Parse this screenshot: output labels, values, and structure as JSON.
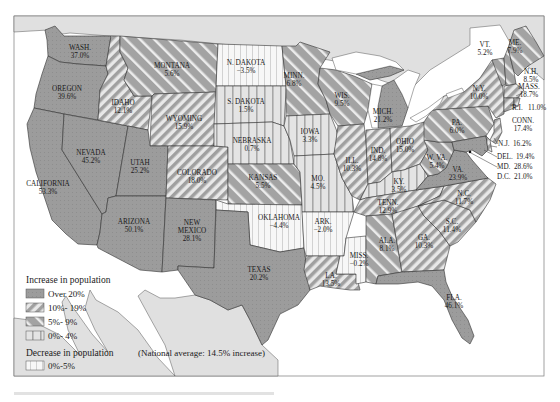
{
  "map": {
    "title": "Population change by state",
    "national_average": "(National average: 14.5% increase)",
    "colors": {
      "background_sea": "#ffffff",
      "neighbor_land": "#dedede",
      "over20": "#9a9a9a",
      "hatch_dark": "#9a9a9a",
      "hatch_light": "#e6e6e6",
      "vertical_dark": "#bdbdbd",
      "vertical_light": "#ececec",
      "border": "#333333",
      "lakes": "#ffffff"
    }
  },
  "legend": {
    "increase_title": "Increase in population",
    "decrease_title": "Decrease in population",
    "items": [
      {
        "key": "over20",
        "label": "Over 20%"
      },
      {
        "key": "p10_19",
        "label": "10%- 19%"
      },
      {
        "key": "p5_9",
        "label": "5%- 9%"
      },
      {
        "key": "p0_4",
        "label": "0%- 4%"
      },
      {
        "key": "dec0_5",
        "label": "0%-5%"
      }
    ]
  },
  "states": [
    {
      "name": "WASH.",
      "value": "37.0%",
      "category": "over20"
    },
    {
      "name": "OREGON",
      "value": "39.6%",
      "category": "over20"
    },
    {
      "name": "CALIFORNIA",
      "value": "53.3%",
      "category": "over20"
    },
    {
      "name": "NEVADA",
      "value": "45.2%",
      "category": "over20"
    },
    {
      "name": "IDAHO",
      "value": "12.1%",
      "category": "p10_19"
    },
    {
      "name": "MONTANA",
      "value": "5.6%",
      "category": "p5_9"
    },
    {
      "name": "WYOMING",
      "value": "15.9%",
      "category": "p10_19"
    },
    {
      "name": "UTAH",
      "value": "25.2%",
      "category": "over20"
    },
    {
      "name": "ARIZONA",
      "value": "50.1%",
      "category": "over20"
    },
    {
      "name": "COLORADO",
      "value": "18.0%",
      "category": "p10_19"
    },
    {
      "name": "NEW MEXICO",
      "value": "28.1%",
      "category": "over20"
    },
    {
      "name": "N. DAKOTA",
      "value": "−3.5%",
      "category": "dec0_5"
    },
    {
      "name": "S. DAKOTA",
      "value": "1.5%",
      "category": "p0_4"
    },
    {
      "name": "NEBRASKA",
      "value": "0.7%",
      "category": "p0_4"
    },
    {
      "name": "KANSAS",
      "value": "5.5%",
      "category": "p5_9"
    },
    {
      "name": "OKLAHOMA",
      "value": "−4.4%",
      "category": "dec0_5"
    },
    {
      "name": "TEXAS",
      "value": "20.2%",
      "category": "over20"
    },
    {
      "name": "MINN.",
      "value": "6.8%",
      "category": "p5_9"
    },
    {
      "name": "IOWA",
      "value": "3.3%",
      "category": "p0_4"
    },
    {
      "name": "MO.",
      "value": "4.5%",
      "category": "p0_4"
    },
    {
      "name": "ARK.",
      "value": "−2.0%",
      "category": "dec0_5"
    },
    {
      "name": "LA.",
      "value": "13.5%",
      "category": "p10_19"
    },
    {
      "name": "WIS.",
      "value": "9.5%",
      "category": "p5_9"
    },
    {
      "name": "ILL.",
      "value": "10.3%",
      "category": "p10_19"
    },
    {
      "name": "MICH.",
      "value": "21.2%",
      "category": "over20"
    },
    {
      "name": "IND.",
      "value": "14.8%",
      "category": "p10_19"
    },
    {
      "name": "OHIO",
      "value": "15.0%",
      "category": "p10_19"
    },
    {
      "name": "KY.",
      "value": "3.5%",
      "category": "p0_4"
    },
    {
      "name": "TENN.",
      "value": "12.9%",
      "category": "p10_19"
    },
    {
      "name": "MISS.",
      "value": "−0.2%",
      "category": "dec0_5"
    },
    {
      "name": "ALA.",
      "value": "8.1%",
      "category": "p5_9"
    },
    {
      "name": "GA.",
      "value": "10.3%",
      "category": "p10_19"
    },
    {
      "name": "FLA.",
      "value": "46.1%",
      "category": "over20"
    },
    {
      "name": "S.C.",
      "value": "11.4%",
      "category": "p10_19"
    },
    {
      "name": "N.C.",
      "value": "11.7%",
      "category": "p10_19"
    },
    {
      "name": "VA.",
      "value": "23.9%",
      "category": "over20"
    },
    {
      "name": "W. VA.",
      "value": "5.4%",
      "category": "p5_9"
    },
    {
      "name": "PA.",
      "value": "6.0%",
      "category": "p5_9"
    },
    {
      "name": "N.Y.",
      "value": "10.0%",
      "category": "p10_19"
    },
    {
      "name": "VT.",
      "value": "5.2%",
      "category": "p5_9"
    },
    {
      "name": "ME.",
      "value": "7.9%",
      "category": "p5_9"
    },
    {
      "name": "N.H.",
      "value": "8.5%",
      "category": "p5_9"
    },
    {
      "name": "MASS.",
      "value": "18.7%",
      "category": "p10_19"
    },
    {
      "name": "R.I.",
      "value": "11.0%",
      "category": "p10_19"
    },
    {
      "name": "CONN.",
      "value": "17.4%",
      "category": "p10_19"
    },
    {
      "name": "N.J.",
      "value": "16.2%",
      "category": "p10_19"
    },
    {
      "name": "DEL.",
      "value": "19.4%",
      "category": "p10_19"
    },
    {
      "name": "MD.",
      "value": "28.6%",
      "category": "over20"
    },
    {
      "name": "D.C.",
      "value": "21.0%",
      "category": "over20"
    }
  ]
}
